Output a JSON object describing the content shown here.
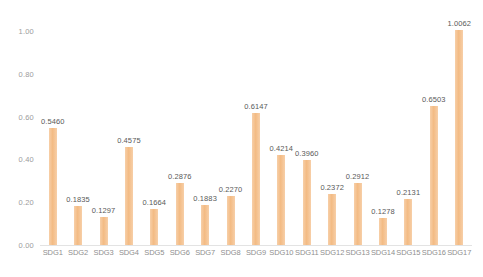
{
  "chart_data": {
    "type": "bar",
    "title": "",
    "subtitle": "",
    "xlabel": "",
    "ylabel": "",
    "ylim": [
      0.0,
      1.0
    ],
    "yticks": [
      "0.00",
      "0.20",
      "0.40",
      "0.60",
      "0.80",
      "1.00"
    ],
    "ytick_values": [
      0.0,
      0.2,
      0.4,
      0.6,
      0.8,
      1.0
    ],
    "grid": false,
    "legend": null,
    "legend_position": "none",
    "bar_color": "#F5C090",
    "label_color": "#595959",
    "axis_text_color": "#9C9C9C",
    "axis_line_color": "#E3E3E3",
    "categories": [
      "SDG1",
      "SDG2",
      "SDG3",
      "SDG4",
      "SDG5",
      "SDG6",
      "SDG7",
      "SDG8",
      "SDG9",
      "SDG10",
      "SDG11",
      "SDG12",
      "SDG13",
      "SDG14",
      "SDG15",
      "SDG16",
      "SDG17"
    ],
    "values": [
      0.546,
      0.1835,
      0.1297,
      0.4575,
      0.1664,
      0.2876,
      0.1883,
      0.227,
      0.6147,
      0.4214,
      0.396,
      0.2372,
      0.2912,
      0.1278,
      0.2131,
      0.6503,
      1.0062
    ],
    "value_labels": [
      "0.5460",
      "0.1835",
      "0.1297",
      "0.4575",
      "0.1664",
      "0.2876",
      "0.1883",
      "0.2270",
      "0.6147",
      "0.4214",
      "0.3960",
      "0.2372",
      "0.2912",
      "0.1278",
      "0.2131",
      "0.6503",
      "1.0062"
    ]
  }
}
